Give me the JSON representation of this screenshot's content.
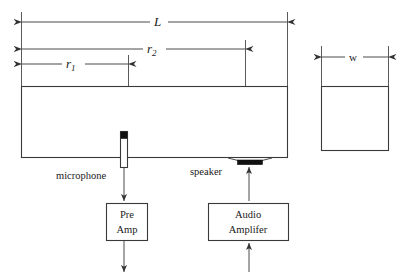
{
  "figure": {
    "background_color": "#ffffff",
    "line_color": "#3a3a3a",
    "fill_color": "#111111"
  },
  "dimensions": [
    {
      "id": "L",
      "label": "L",
      "subscript": "",
      "italic": true,
      "span_from": 21,
      "span_to": 287,
      "y": 22
    },
    {
      "id": "r2",
      "label": "r",
      "subscript": "2",
      "italic": true,
      "span_from": 21,
      "span_to": 245,
      "y": 49
    },
    {
      "id": "r1",
      "label": "r",
      "subscript": "1",
      "italic": true,
      "span_from": 21,
      "span_to": 128,
      "y": 64
    },
    {
      "id": "w",
      "label": "w",
      "subscript": "",
      "italic": false,
      "span_from": 321,
      "span_to": 389,
      "y": 57
    }
  ],
  "shapes": {
    "tube_top_view": {
      "x": 21,
      "y": 86,
      "width": 267,
      "height": 72
    },
    "tube_end_view": {
      "x": 321,
      "y": 86,
      "width": 68,
      "height": 65
    }
  },
  "components": {
    "microphone": {
      "label": "microphone",
      "label_x": 56,
      "label_y": 179,
      "body_x": 120,
      "body_y": 131,
      "body_width": 7,
      "body_height": 37,
      "tip_height": 7
    },
    "speaker": {
      "label": "speaker",
      "label_x": 190,
      "label_y": 175,
      "cone_top_left": 228,
      "cone_top_right": 272,
      "cone_bottom_left": 238,
      "cone_bottom_right": 262,
      "cone_top_y": 158,
      "cone_bottom_y": 160,
      "bar_height": 5
    }
  },
  "blocks": [
    {
      "id": "pre-amp",
      "lines": [
        "Pre",
        "Amp"
      ],
      "x": 106,
      "y": 203,
      "width": 42,
      "height": 38
    },
    {
      "id": "audio-amplifier",
      "lines": [
        "Audio",
        "Amplifer"
      ],
      "x": 208,
      "y": 203,
      "width": 81,
      "height": 38
    }
  ],
  "signal_arrows": [
    {
      "id": "mic-to-preamp",
      "x": 124,
      "y_from": 168,
      "y_to": 201,
      "direction": "down"
    },
    {
      "id": "preamp-output",
      "x": 124,
      "y_from": 241,
      "y_to": 272,
      "direction": "down"
    },
    {
      "id": "amp-to-speaker",
      "x": 249,
      "y_from": 201,
      "y_to": 167,
      "direction": "up"
    },
    {
      "id": "amp-input",
      "x": 249,
      "y_from": 272,
      "y_to": 243,
      "direction": "up"
    }
  ]
}
